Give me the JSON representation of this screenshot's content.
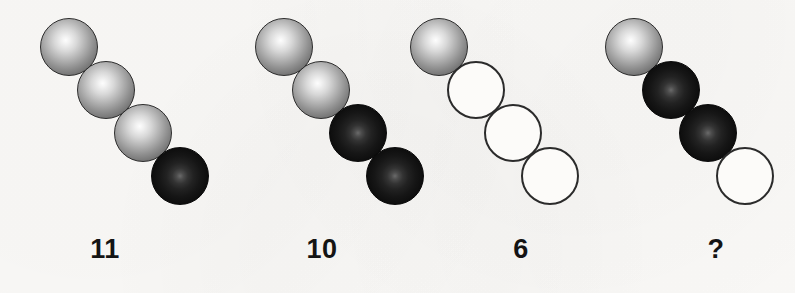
{
  "puzzle": {
    "type": "visual-sequence-puzzle",
    "background_color": "#fbfaf8",
    "sphere_states": {
      "light": "light-shaded-sphere",
      "dark": "dark-filled-sphere",
      "empty": "empty-outline-circle"
    },
    "state_colors": {
      "light_highlight": "#fdfdfd",
      "light_edge": "#3b3b3b",
      "dark_center": "#6a6a6a",
      "dark_edge": "#080808",
      "empty_fill": "#fcfbf9",
      "empty_stroke": "#2b2b2b"
    },
    "groups": [
      {
        "id": "group-1",
        "label": "11",
        "label_x": 105,
        "origin_x": 40,
        "origin_y": 18,
        "balls": [
          {
            "state": "light",
            "dx": 0,
            "dy": 0
          },
          {
            "state": "light",
            "dx": 37,
            "dy": 43
          },
          {
            "state": "light",
            "dx": 74,
            "dy": 86
          },
          {
            "state": "dark",
            "dx": 111,
            "dy": 129
          }
        ]
      },
      {
        "id": "group-2",
        "label": "10",
        "label_x": 322,
        "origin_x": 255,
        "origin_y": 18,
        "balls": [
          {
            "state": "light",
            "dx": 0,
            "dy": 0
          },
          {
            "state": "light",
            "dx": 37,
            "dy": 43
          },
          {
            "state": "dark",
            "dx": 74,
            "dy": 86
          },
          {
            "state": "dark",
            "dx": 111,
            "dy": 129
          }
        ]
      },
      {
        "id": "group-3",
        "label": "6",
        "label_x": 521,
        "origin_x": 410,
        "origin_y": 18,
        "balls": [
          {
            "state": "light",
            "dx": 0,
            "dy": 0
          },
          {
            "state": "empty",
            "dx": 37,
            "dy": 43
          },
          {
            "state": "empty",
            "dx": 74,
            "dy": 86
          },
          {
            "state": "empty",
            "dx": 111,
            "dy": 129
          }
        ]
      },
      {
        "id": "group-4",
        "label": "?",
        "label_x": 716,
        "origin_x": 605,
        "origin_y": 18,
        "balls": [
          {
            "state": "light",
            "dx": 0,
            "dy": 0
          },
          {
            "state": "dark",
            "dx": 37,
            "dy": 43
          },
          {
            "state": "dark",
            "dx": 74,
            "dy": 86
          },
          {
            "state": "empty",
            "dx": 111,
            "dy": 129
          }
        ]
      }
    ],
    "label_baseline_y": 234
  }
}
